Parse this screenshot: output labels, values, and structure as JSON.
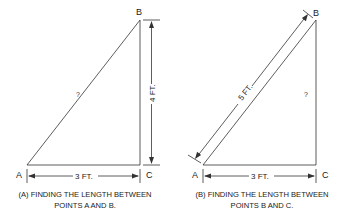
{
  "diagram_a": {
    "points": {
      "A": "A",
      "B": "B",
      "C": "C"
    },
    "hypotenuse_label": "?",
    "vertical_dimension": "4 FT.",
    "horizontal_dimension": "3 FT.",
    "caption_line1": "(A) FINDING THE LENGTH BETWEEN",
    "caption_line2": "POINTS A AND B."
  },
  "diagram_b": {
    "points": {
      "A": "A",
      "B": "B",
      "C": "C"
    },
    "vertical_label": "?",
    "hypotenuse_dimension": "5 FT.",
    "horizontal_dimension": "3 FT.",
    "caption_line1": "(B) FINDING THE LENGTH BETWEEN",
    "caption_line2": "POINTS B AND C."
  }
}
